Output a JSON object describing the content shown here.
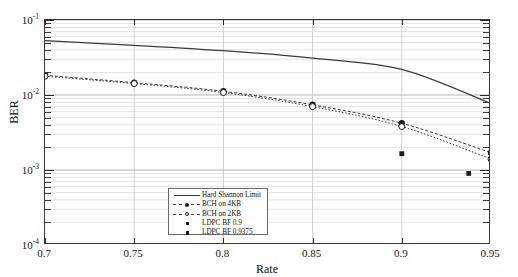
{
  "chart_data": {
    "type": "line",
    "title": "",
    "xlabel": "Rate",
    "ylabel": "BER",
    "xlim": [
      0.7,
      0.95
    ],
    "ylim": [
      0.0001,
      0.1
    ],
    "yscale": "log",
    "grid": true,
    "legend_position": "bottom-center",
    "xticks": [
      "0.7",
      "0.75",
      "0.8",
      "0.85",
      "0.9",
      "0.95"
    ],
    "xtick_values": [
      0.7,
      0.75,
      0.8,
      0.85,
      0.9,
      0.95
    ],
    "yticks": [
      "10-1",
      "10-2",
      "10-3",
      "10-4"
    ],
    "ytick_values": [
      0.1,
      0.01,
      0.001,
      0.0001
    ],
    "series": [
      {
        "name": "Hard Shannon Limit",
        "style": "solid",
        "marker": "none",
        "x": [
          0.7,
          0.75,
          0.8,
          0.85,
          0.9,
          0.95
        ],
        "values": [
          0.053,
          0.046,
          0.039,
          0.031,
          0.022,
          0.0077
        ]
      },
      {
        "name": "BCH on 4KB",
        "style": "dashed",
        "marker": "filled-circle",
        "x": [
          0.7,
          0.75,
          0.8,
          0.85,
          0.9,
          0.95
        ],
        "values": [
          0.0183,
          0.0146,
          0.0112,
          0.0074,
          0.0042,
          0.0017
        ]
      },
      {
        "name": "BCH on 2KB",
        "style": "dashed",
        "marker": "open-circle",
        "x": [
          0.7,
          0.75,
          0.8,
          0.85,
          0.9,
          0.95
        ],
        "values": [
          0.0178,
          0.0142,
          0.0108,
          0.007,
          0.0038,
          0.0014
        ]
      },
      {
        "name": "LDPC BF 0.9",
        "style": "none",
        "marker": "filled-square",
        "x": [
          0.9
        ],
        "values": [
          0.00165
        ]
      },
      {
        "name": "LDPC BF 0.9375",
        "style": "none",
        "marker": "filled-square",
        "x": [
          0.9375
        ],
        "values": [
          0.0009
        ]
      }
    ]
  },
  "axes": {
    "x_title": "Rate",
    "y_title": "BER",
    "y_labels": [
      {
        "text": "10",
        "exp": "-1"
      },
      {
        "text": "10",
        "exp": "-2"
      },
      {
        "text": "10",
        "exp": "-3"
      },
      {
        "text": "10",
        "exp": "-4"
      }
    ]
  },
  "legend": {
    "items": [
      {
        "label": "Hard Shannon Limit",
        "symbol": "solid-line"
      },
      {
        "label": "BCH on 4KB",
        "symbol": "dashed-filled-circle"
      },
      {
        "label": "BCH on 2KB",
        "symbol": "dashed-open-circle"
      },
      {
        "label": "LDPC BF 0.9",
        "symbol": "filled-square"
      },
      {
        "label": "LDPC BF 0.9375",
        "symbol": "filled-square"
      }
    ]
  },
  "colors": {
    "axis": "#3a3a3a",
    "grid_minor": "#d9d9d9",
    "grid_major": "#b0b0b0",
    "series_line": "#3a3a3a",
    "marker": "#1a1a1a",
    "background": "#ffffff"
  }
}
